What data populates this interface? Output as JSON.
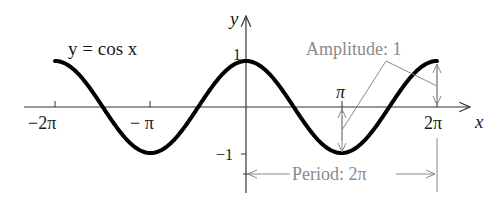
{
  "chart_data": {
    "type": "line",
    "title": "y = cos x",
    "function": "cos(x)",
    "xlabel": "x",
    "ylabel": "y",
    "x_range": [
      "-2π",
      "2π"
    ],
    "xlim": [
      -6.2832,
      6.2832
    ],
    "ylim": [
      -1,
      1
    ],
    "x_ticks": [
      "-2π",
      "-π",
      "π",
      "2π"
    ],
    "y_ticks": [
      "1",
      "-1"
    ],
    "grid": false,
    "series": [
      {
        "name": "y = cos x",
        "x": [
          -6.2832,
          -4.7124,
          -3.1416,
          -1.5708,
          0,
          1.5708,
          3.1416,
          4.7124,
          6.2832
        ],
        "values": [
          1,
          0,
          -1,
          0,
          1,
          0,
          -1,
          0,
          1
        ]
      }
    ],
    "annotations": [
      {
        "text": "Amplitude: 1",
        "type": "double-arrow",
        "description": "vertical arrows from x-axis to curve at x=π (down to -1) and x=2π (up to 1)"
      },
      {
        "text": "Period: 2π",
        "type": "horizontal-bracket",
        "description": "arrow spanning from x=0 to x=2π below the graph"
      }
    ]
  },
  "labels": {
    "equation": "y = cos x",
    "y_axis": "y",
    "x_axis": "x",
    "tick_neg_2pi": "−2π",
    "tick_neg_pi": "− π",
    "tick_pi": "π",
    "tick_2pi": "2π",
    "tick_one": "1",
    "tick_neg_one": "−1",
    "amplitude": "Amplitude: 1",
    "period": "Period: 2π"
  },
  "colors": {
    "curve": "#000000",
    "axes": "#333333",
    "annotation": "#8a8a8a"
  }
}
